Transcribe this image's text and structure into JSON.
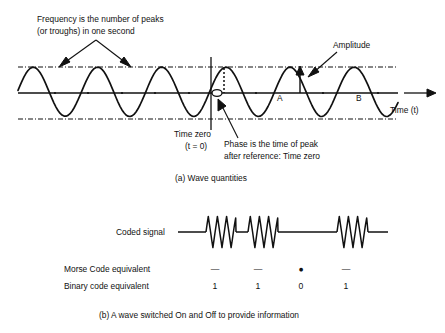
{
  "figure": {
    "panel_a": {
      "caption": "(a) Wave quantities",
      "annotations": {
        "frequency_line1": "Frequency is the number of peaks",
        "frequency_line2": "(or troughs) in one second",
        "amplitude": "Amplitude",
        "time_zero_line1": "Time zero",
        "time_zero_line2": "(t = 0)",
        "phase_line1": "Phase is the time of peak",
        "phase_line2": "after reference: Time zero"
      },
      "axis_label": "Time (t)",
      "point_labels": [
        "A",
        "B"
      ]
    },
    "panel_b": {
      "caption": "(b) A wave switched On and Off to provide information",
      "signal_label": "Coded signal",
      "row_labels": [
        "Morse Code equivalent",
        "Binary code equivalent"
      ],
      "morse": [
        "—",
        "—",
        "●",
        "—"
      ],
      "binary": [
        "1",
        "1",
        "0",
        "1"
      ]
    },
    "colors": {
      "stroke": "#111111",
      "background": "#ffffff"
    }
  }
}
